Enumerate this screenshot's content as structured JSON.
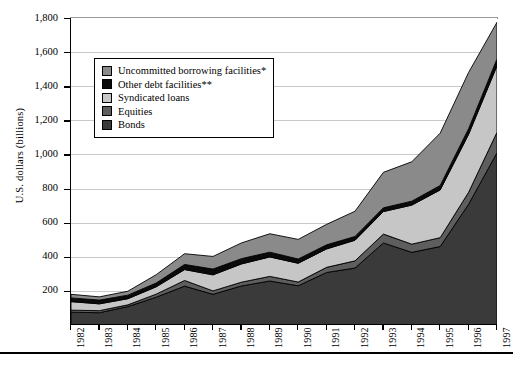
{
  "chart_data": {
    "type": "area",
    "stacked": true,
    "title": "",
    "xlabel": "",
    "ylabel": "U.S. dollars (billions)",
    "ylim": [
      0,
      1800
    ],
    "ytick_values": [
      200,
      400,
      600,
      800,
      1000,
      1200,
      1400,
      1600,
      1800
    ],
    "ytick_labels": [
      "200",
      "400",
      "600",
      "800",
      "1,000",
      "1,200",
      "1,400",
      "1,600",
      "1,800"
    ],
    "grid": true,
    "legend_position": "upper-left-inside",
    "categories": [
      1982,
      1983,
      1984,
      1985,
      1986,
      1987,
      1988,
      1989,
      1990,
      1991,
      1992,
      1993,
      1994,
      1995,
      1996,
      1997
    ],
    "xtick_labels": [
      "1982",
      "1983",
      "1984",
      "1985",
      "1986",
      "1987",
      "1988",
      "1989",
      "1990",
      "1991",
      "1992",
      "1993",
      "1994",
      "1995",
      "1996",
      "1997"
    ],
    "series": [
      {
        "name": "Bonds",
        "color": "#3a3a3a",
        "values": [
          75,
          72,
          108,
          163,
          228,
          180,
          229,
          258,
          230,
          308,
          334,
          481,
          426,
          460,
          708,
          1010
        ]
      },
      {
        "name": "Equities",
        "color": "#5e5e5e",
        "values": [
          12,
          12,
          10,
          18,
          33,
          20,
          22,
          27,
          22,
          30,
          42,
          52,
          48,
          52,
          70,
          120
        ]
      },
      {
        "name": "Syndicated loans",
        "color": "#c6c6c6",
        "values": [
          50,
          40,
          36,
          43,
          64,
          94,
          107,
          114,
          110,
          108,
          121,
          132,
          229,
          280,
          340,
          390
        ]
      },
      {
        "name": "Other debt facilities**",
        "color": "#0a0a0a",
        "values": [
          22,
          22,
          21,
          22,
          30,
          34,
          31,
          28,
          25,
          24,
          22,
          22,
          23,
          26,
          33,
          40
        ]
      },
      {
        "name": "Uncommitted borrowing facilities*",
        "color": "#8a8a8a",
        "values": [
          21,
          19,
          23,
          49,
          63,
          74,
          92,
          108,
          115,
          120,
          148,
          208,
          231,
          307,
          330,
          215
        ]
      }
    ],
    "totals": [
      180,
      165,
      198,
      295,
      418,
      402,
      481,
      535,
      502,
      590,
      667,
      895,
      957,
      1125,
      1481,
      1775
    ]
  },
  "legend": {
    "items": [
      {
        "label": "Uncommitted borrowing facilities*",
        "color": "#8a8a8a"
      },
      {
        "label": "Other debt facilities**",
        "color": "#0a0a0a"
      },
      {
        "label": "Syndicated loans",
        "color": "#c6c6c6"
      },
      {
        "label": "Equities",
        "color": "#5e5e5e"
      },
      {
        "label": "Bonds",
        "color": "#3a3a3a"
      }
    ]
  }
}
